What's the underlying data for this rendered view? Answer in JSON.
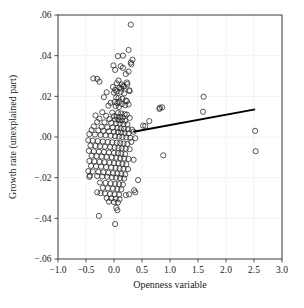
{
  "chart_data": {
    "type": "scatter",
    "title": "",
    "xlabel": "Openness variable",
    "ylabel": "Growth rate (unexplained part)",
    "xlim": [
      -1.0,
      3.0
    ],
    "ylim": [
      -0.06,
      0.06
    ],
    "grid": true,
    "legend": null,
    "xticks": [
      -1.0,
      -0.5,
      0.0,
      0.5,
      1.0,
      1.5,
      2.0,
      2.5,
      3.0
    ],
    "xticklabels": [
      "−1.0",
      "−0.5",
      "0.0",
      "0.5",
      "1.0",
      "1.5",
      "2.0",
      "2.5",
      "3.0"
    ],
    "yticks": [
      -0.06,
      -0.04,
      -0.02,
      0.0,
      0.02,
      0.04,
      0.06
    ],
    "yticklabels": [
      "−.06",
      "−.04",
      "−.02",
      ".00",
      ".02",
      ".04",
      ".06"
    ],
    "marker": "open-circle",
    "marker_size": 2.6,
    "fit_line": {
      "name": "regression fit",
      "x": [
        0.35,
        2.52
      ],
      "y": [
        0.0026,
        0.0136
      ]
    },
    "series": [
      {
        "name": "countries",
        "points": [
          [
            0.3,
            0.0553
          ],
          [
            0.26,
            0.0428
          ],
          [
            0.16,
            0.04
          ],
          [
            0.07,
            0.0398
          ],
          [
            0.33,
            0.038
          ],
          [
            0.3,
            0.0366
          ],
          [
            0.31,
            0.0358
          ],
          [
            -0.01,
            0.0352
          ],
          [
            0.12,
            0.0348
          ],
          [
            0.16,
            0.034
          ],
          [
            0.02,
            0.033
          ],
          [
            0.26,
            0.0322
          ],
          [
            0.21,
            0.031
          ],
          [
            -0.37,
            0.0288
          ],
          [
            -0.3,
            0.0286
          ],
          [
            -0.26,
            0.0272
          ],
          [
            0.08,
            0.0278
          ],
          [
            0.23,
            0.0268
          ],
          [
            0.05,
            0.0264
          ],
          [
            0.24,
            0.026
          ],
          [
            0.14,
            0.0258
          ],
          [
            0.16,
            0.025
          ],
          [
            0.18,
            0.0248
          ],
          [
            -0.02,
            0.0246
          ],
          [
            0.1,
            0.0242
          ],
          [
            0.13,
            0.0238
          ],
          [
            0.02,
            0.0232
          ],
          [
            0.27,
            0.023
          ],
          [
            0.28,
            0.0226
          ],
          [
            0.05,
            0.0224
          ],
          [
            0.12,
            0.0222
          ],
          [
            -0.13,
            0.022
          ],
          [
            0.0,
            0.0218
          ],
          [
            0.18,
            0.0214
          ],
          [
            1.6,
            0.0198
          ],
          [
            -0.18,
            0.0196
          ],
          [
            0.04,
            0.0194
          ],
          [
            0.08,
            0.0192
          ],
          [
            0.15,
            0.0188
          ],
          [
            0.21,
            0.018
          ],
          [
            0.23,
            0.0176
          ],
          [
            0.1,
            0.0174
          ],
          [
            0.01,
            0.0172
          ],
          [
            -0.06,
            0.0168
          ],
          [
            0.06,
            0.0166
          ],
          [
            0.14,
            0.0162
          ],
          [
            0.26,
            0.016
          ],
          [
            0.2,
            0.0156
          ],
          [
            -0.1,
            0.0154
          ],
          [
            0.03,
            0.0152
          ],
          [
            0.09,
            0.0148
          ],
          [
            0.86,
            0.0146
          ],
          [
            0.82,
            0.0144
          ],
          [
            0.81,
            0.0138
          ],
          [
            1.59,
            0.0124
          ],
          [
            -0.21,
            0.0122
          ],
          [
            -0.03,
            0.012
          ],
          [
            0.07,
            0.0118
          ],
          [
            0.13,
            0.0116
          ],
          [
            0.19,
            0.0112
          ],
          [
            0.23,
            0.011
          ],
          [
            -0.33,
            0.0106
          ],
          [
            -0.14,
            0.0104
          ],
          [
            0.0,
            0.0102
          ],
          [
            0.05,
            0.01
          ],
          [
            0.11,
            0.0098
          ],
          [
            0.16,
            0.0096
          ],
          [
            0.28,
            0.0094
          ],
          [
            -0.26,
            0.009
          ],
          [
            -0.08,
            0.0088
          ],
          [
            0.02,
            0.0086
          ],
          [
            0.08,
            0.0084
          ],
          [
            0.14,
            0.0082
          ],
          [
            0.2,
            0.008
          ],
          [
            0.63,
            0.0078
          ],
          [
            -0.3,
            0.0074
          ],
          [
            -0.17,
            0.0072
          ],
          [
            -0.05,
            0.007
          ],
          [
            0.04,
            0.0068
          ],
          [
            0.1,
            0.0066
          ],
          [
            0.17,
            0.0064
          ],
          [
            0.24,
            0.0062
          ],
          [
            0.52,
            0.0056
          ],
          [
            0.56,
            0.0054
          ],
          [
            -0.36,
            0.0052
          ],
          [
            -0.22,
            0.005
          ],
          [
            -0.12,
            0.0048
          ],
          [
            -0.02,
            0.0046
          ],
          [
            0.06,
            0.0044
          ],
          [
            0.12,
            0.0042
          ],
          [
            0.18,
            0.004
          ],
          [
            0.25,
            0.0038
          ],
          [
            0.32,
            0.0036
          ],
          [
            -0.4,
            0.0034
          ],
          [
            -0.28,
            0.0032
          ],
          [
            -0.19,
            0.003
          ],
          [
            -0.09,
            0.0028
          ],
          [
            0.0,
            0.0026
          ],
          [
            0.07,
            0.0024
          ],
          [
            0.13,
            0.0022
          ],
          [
            0.19,
            0.002
          ],
          [
            0.26,
            0.0018
          ],
          [
            0.35,
            0.0026
          ],
          [
            2.52,
            0.003
          ],
          [
            -0.44,
            0.0014
          ],
          [
            -0.34,
            0.0012
          ],
          [
            -0.24,
            0.001
          ],
          [
            -0.15,
            0.0008
          ],
          [
            -0.06,
            0.0006
          ],
          [
            0.02,
            0.0004
          ],
          [
            0.09,
            0.0002
          ],
          [
            0.15,
            0.0
          ],
          [
            0.22,
            -0.0002
          ],
          [
            0.29,
            -0.0004
          ],
          [
            0.38,
            -0.0006
          ],
          [
            -0.46,
            -0.0016
          ],
          [
            -0.38,
            -0.0018
          ],
          [
            -0.29,
            -0.002
          ],
          [
            -0.2,
            -0.0022
          ],
          [
            -0.11,
            -0.0024
          ],
          [
            -0.03,
            -0.0026
          ],
          [
            0.05,
            -0.0028
          ],
          [
            0.11,
            -0.003
          ],
          [
            0.17,
            -0.0032
          ],
          [
            0.24,
            -0.0034
          ],
          [
            0.31,
            -0.0024
          ],
          [
            -0.42,
            -0.0042
          ],
          [
            -0.33,
            -0.0044
          ],
          [
            -0.25,
            -0.0046
          ],
          [
            -0.16,
            -0.0048
          ],
          [
            -0.07,
            -0.005
          ],
          [
            0.01,
            -0.0052
          ],
          [
            0.08,
            -0.0054
          ],
          [
            0.14,
            -0.0056
          ],
          [
            0.21,
            -0.0058
          ],
          [
            0.28,
            -0.006
          ],
          [
            -0.45,
            -0.0068
          ],
          [
            -0.36,
            -0.007
          ],
          [
            -0.27,
            -0.0072
          ],
          [
            -0.18,
            -0.0074
          ],
          [
            -0.09,
            -0.0076
          ],
          [
            0.0,
            -0.0078
          ],
          [
            0.07,
            -0.008
          ],
          [
            0.13,
            -0.0082
          ],
          [
            0.2,
            -0.0084
          ],
          [
            2.53,
            -0.007
          ],
          [
            -0.4,
            -0.0092
          ],
          [
            -0.31,
            -0.0094
          ],
          [
            -0.22,
            -0.0096
          ],
          [
            -0.13,
            -0.0098
          ],
          [
            -0.04,
            -0.01
          ],
          [
            0.04,
            -0.0102
          ],
          [
            0.11,
            -0.0104
          ],
          [
            0.18,
            -0.0106
          ],
          [
            0.26,
            -0.0108
          ],
          [
            0.35,
            -0.0112
          ],
          [
            0.88,
            -0.009
          ],
          [
            -0.44,
            -0.0118
          ],
          [
            -0.35,
            -0.012
          ],
          [
            -0.26,
            -0.0122
          ],
          [
            -0.17,
            -0.0124
          ],
          [
            -0.08,
            -0.0126
          ],
          [
            0.0,
            -0.0128
          ],
          [
            0.08,
            -0.013
          ],
          [
            0.15,
            -0.0132
          ],
          [
            0.22,
            -0.0134
          ],
          [
            -0.41,
            -0.0142
          ],
          [
            -0.32,
            -0.0144
          ],
          [
            -0.23,
            -0.0146
          ],
          [
            -0.14,
            -0.0148
          ],
          [
            -0.05,
            -0.015
          ],
          [
            0.03,
            -0.0152
          ],
          [
            0.1,
            -0.0154
          ],
          [
            0.17,
            -0.0156
          ],
          [
            0.25,
            -0.0158
          ],
          [
            -0.46,
            -0.0168
          ],
          [
            -0.38,
            -0.017
          ],
          [
            -0.28,
            -0.0172
          ],
          [
            -0.19,
            -0.0174
          ],
          [
            -0.1,
            -0.0176
          ],
          [
            -0.02,
            -0.0178
          ],
          [
            0.06,
            -0.018
          ],
          [
            0.13,
            -0.0182
          ],
          [
            0.2,
            -0.0184
          ],
          [
            -0.43,
            -0.019
          ],
          [
            -0.44,
            -0.0196
          ],
          [
            -0.3,
            -0.0192
          ],
          [
            -0.21,
            -0.0194
          ],
          [
            -0.12,
            -0.0196
          ],
          [
            -0.04,
            -0.0198
          ],
          [
            0.04,
            -0.02
          ],
          [
            0.11,
            -0.0202
          ],
          [
            0.18,
            -0.0204
          ],
          [
            0.43,
            -0.0212
          ],
          [
            -0.25,
            -0.0224
          ],
          [
            -0.15,
            -0.0226
          ],
          [
            -0.06,
            -0.0228
          ],
          [
            0.02,
            -0.023
          ],
          [
            0.09,
            -0.0232
          ],
          [
            0.16,
            -0.0234
          ],
          [
            -0.2,
            -0.025
          ],
          [
            -0.11,
            -0.0252
          ],
          [
            -0.02,
            -0.0254
          ],
          [
            0.06,
            -0.0256
          ],
          [
            0.13,
            -0.0258
          ],
          [
            0.36,
            -0.0262
          ],
          [
            0.38,
            -0.0272
          ],
          [
            -0.3,
            -0.0272
          ],
          [
            -0.24,
            -0.0276
          ],
          [
            -0.16,
            -0.0278
          ],
          [
            -0.07,
            -0.028
          ],
          [
            0.01,
            -0.0282
          ],
          [
            0.09,
            -0.0284
          ],
          [
            0.21,
            -0.0286
          ],
          [
            0.27,
            -0.0282
          ],
          [
            -0.13,
            -0.03
          ],
          [
            -0.05,
            -0.0302
          ],
          [
            0.03,
            -0.0304
          ],
          [
            0.1,
            -0.0306
          ],
          [
            -0.09,
            -0.0318
          ],
          [
            0.0,
            -0.032
          ],
          [
            0.07,
            -0.0322
          ],
          [
            0.04,
            -0.0348
          ],
          [
            0.06,
            -0.036
          ],
          [
            -0.27,
            -0.0388
          ],
          [
            0.02,
            -0.0428
          ]
        ]
      }
    ]
  }
}
